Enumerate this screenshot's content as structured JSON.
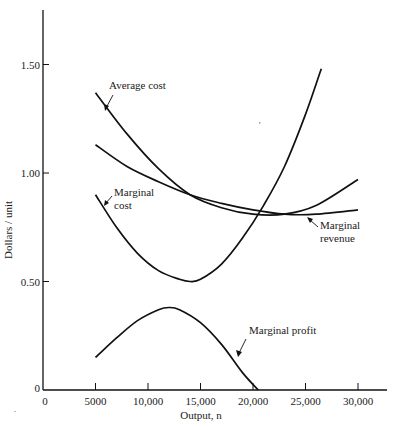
{
  "chart_data": {
    "type": "line",
    "title": "",
    "xlabel": "Output, n",
    "ylabel": "Dollars / unit",
    "xlim": [
      0,
      32500
    ],
    "ylim": [
      0,
      1.75
    ],
    "grid": false,
    "legend": "none (inline annotations)",
    "x_ticks": [
      0,
      5000,
      10000,
      15000,
      20000,
      25000,
      30000
    ],
    "x_tick_labels": [
      "0",
      "5000",
      "10,000",
      "15,000",
      "20,000",
      "25,000",
      "30,000"
    ],
    "y_ticks": [
      0,
      0.5,
      1.0,
      1.5
    ],
    "y_tick_labels": [
      "0",
      "0.50",
      "1.00",
      "1.50"
    ],
    "series": [
      {
        "name": "Average cost",
        "x": [
          5000,
          8000,
          11000,
          14000,
          17000,
          20000,
          23000,
          26000,
          30000
        ],
        "values": [
          1.37,
          1.18,
          1.02,
          0.9,
          0.84,
          0.81,
          0.81,
          0.85,
          0.97
        ]
      },
      {
        "name": "Marginal revenue",
        "x": [
          5000,
          8000,
          11000,
          14000,
          17000,
          20000,
          23000,
          26000,
          30000
        ],
        "values": [
          1.13,
          1.03,
          0.96,
          0.9,
          0.86,
          0.83,
          0.81,
          0.81,
          0.83
        ]
      },
      {
        "name": "Marginal cost",
        "x": [
          5000,
          7000,
          9000,
          11000,
          13000,
          14000,
          15000,
          17000,
          19000,
          21000,
          23000,
          25000,
          26500
        ],
        "values": [
          0.9,
          0.75,
          0.63,
          0.55,
          0.51,
          0.5,
          0.51,
          0.58,
          0.7,
          0.85,
          1.03,
          1.27,
          1.48
        ]
      },
      {
        "name": "Marginal profit",
        "x": [
          5000,
          7000,
          9000,
          11000,
          12000,
          13000,
          15000,
          17000,
          19000,
          20500
        ],
        "values": [
          0.15,
          0.24,
          0.32,
          0.37,
          0.38,
          0.37,
          0.31,
          0.21,
          0.08,
          0.0
        ]
      }
    ],
    "annotations": [
      {
        "text": "Average cost",
        "points_to": "Average cost"
      },
      {
        "text": "Marginal cost",
        "points_to": "Marginal cost"
      },
      {
        "text": "Marginal revenue",
        "points_to": "Marginal revenue"
      },
      {
        "text": "Marginal profit",
        "points_to": "Marginal profit"
      }
    ]
  },
  "labels": {
    "avg_cost": "Average cost",
    "mc_line1": "Marginal",
    "mc_line2": "cost",
    "mr_line1": "Marginal",
    "mr_line2": "revenue",
    "mp": "Marginal profit"
  }
}
